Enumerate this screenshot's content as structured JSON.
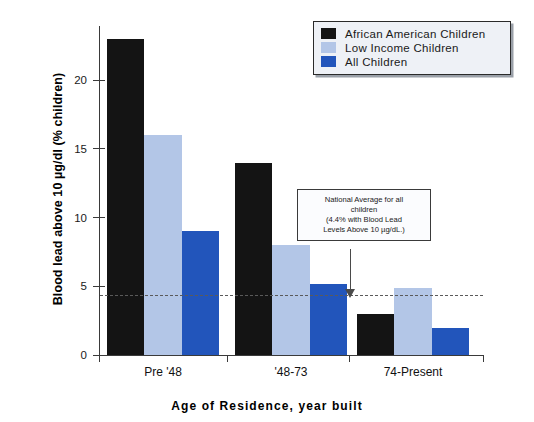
{
  "chart_data": {
    "type": "bar",
    "title": "",
    "xlabel": "Age of Residence, year built",
    "ylabel": "Blood lead above 10 µg/dl (% children)",
    "categories": [
      "Pre '48",
      "'48-73",
      "74-Present"
    ],
    "series": [
      {
        "name": "African American Children",
        "color": "#141414",
        "values": [
          23,
          14,
          3
        ]
      },
      {
        "name": "Low Income Children",
        "color": "#b3c6e7",
        "values": [
          16,
          8,
          4.9
        ]
      },
      {
        "name": "All Children",
        "color": "#2255bb",
        "values": [
          9,
          5.2,
          2
        ]
      }
    ],
    "ylim": [
      0,
      24
    ],
    "yticks": [
      0,
      5,
      10,
      15,
      20
    ],
    "ytick_labels": [
      "0",
      "5",
      "10",
      "15",
      "20"
    ],
    "grid": false,
    "legend_position": "top-right",
    "reference_line": {
      "value": 4.4,
      "style": "dashed",
      "color": "#5a5a5a",
      "label": "National Average for all children"
    },
    "annotations": [
      {
        "name": "national-average-callout",
        "lines": [
          "National Average for all",
          "children",
          "(4.4% with Blood Lead",
          "Levels Above 10 µg/dL.)"
        ]
      }
    ]
  },
  "legend": {
    "entries": [
      {
        "label": "African American Children",
        "color": "#141414"
      },
      {
        "label": "Low Income Children",
        "color": "#b3c6e7"
      },
      {
        "label": "All Children",
        "color": "#2255bb"
      }
    ]
  }
}
